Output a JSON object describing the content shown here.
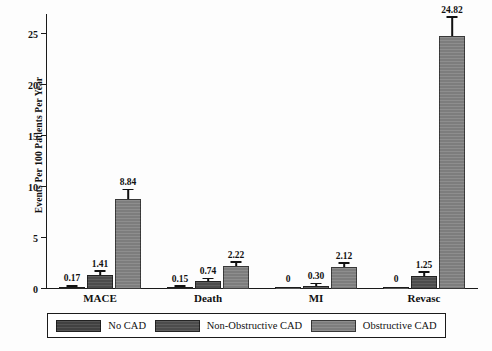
{
  "chart_data": {
    "type": "bar",
    "title": "",
    "xlabel": "",
    "ylabel": "Events Per 100 Patients Per Year",
    "ylim": [
      0,
      27
    ],
    "yticks": [
      0,
      5,
      10,
      15,
      20,
      25
    ],
    "ytick_labels": [
      "0",
      "5",
      "10",
      "15",
      "20",
      "25"
    ],
    "grid": false,
    "legend_position": "bottom",
    "categories": [
      "MACE",
      "Death",
      "MI",
      "Revasc"
    ],
    "series": [
      {
        "name": "No CAD",
        "color": "#414141",
        "values": [
          0.17,
          0.15,
          0,
          0
        ],
        "labels": [
          "0.17",
          "0.15",
          "0",
          "0"
        ],
        "err_low": [
          0.1,
          0.09,
          0,
          0
        ],
        "err_high": [
          0.26,
          0.23,
          0,
          0
        ]
      },
      {
        "name": "Non-Obstructive CAD",
        "color": "#4c4c4c",
        "values": [
          1.41,
          0.74,
          0.3,
          1.25
        ],
        "labels": [
          "1.41",
          "0.74",
          "0.30",
          "1.25"
        ],
        "err_low": [
          1.15,
          0.55,
          0.18,
          0.95
        ],
        "err_high": [
          1.7,
          0.96,
          0.45,
          1.62
        ]
      },
      {
        "name": "Obstructive CAD",
        "color": "#7d7d7d",
        "values": [
          8.84,
          2.22,
          2.12,
          24.82
        ],
        "labels": [
          "8.84",
          "2.22",
          "2.12",
          "24.82"
        ],
        "err_low": [
          8.05,
          1.9,
          1.8,
          22.55
        ],
        "err_high": [
          9.7,
          2.58,
          2.48,
          26.6
        ]
      }
    ]
  },
  "legend": {
    "items": [
      {
        "label": "No CAD"
      },
      {
        "label": "Non-Obstructive CAD"
      },
      {
        "label": "Obstructive CAD"
      }
    ]
  },
  "caption_fragment": ""
}
